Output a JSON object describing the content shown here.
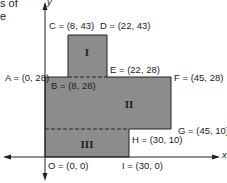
{
  "cut_text": {
    "line1": "s of",
    "line2": "e"
  },
  "axes": {
    "x_label": "x",
    "y_label": "y"
  },
  "colors": {
    "fill": "#8c8c8c",
    "stroke": "#222222"
  },
  "regions": [
    {
      "id": "I",
      "label": "I"
    },
    {
      "id": "II",
      "label": "II"
    },
    {
      "id": "III",
      "label": "III"
    }
  ],
  "points": {
    "A": {
      "name": "A",
      "text": "A = (0, 28)"
    },
    "B": {
      "name": "B",
      "text": "B = (8, 28)"
    },
    "C": {
      "name": "C",
      "text": "C = (8, 43)"
    },
    "D": {
      "name": "D",
      "text": "D = (22, 43)"
    },
    "E": {
      "name": "E",
      "text": "E = (22, 28)"
    },
    "F": {
      "name": "F",
      "text": "F = (45, 28)"
    },
    "G": {
      "name": "G",
      "text": "G = (45, 10)"
    },
    "H": {
      "name": "H",
      "text": "H = (30, 10)"
    },
    "I": {
      "name": "I",
      "text": "I = (30, 0)"
    },
    "O": {
      "name": "O",
      "text": "O = (0, 0)"
    }
  }
}
